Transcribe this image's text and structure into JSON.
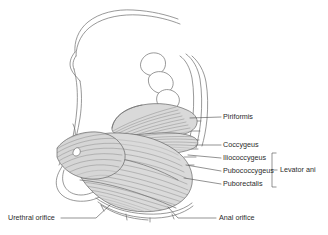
{
  "figure": {
    "background_color": "#ffffff",
    "line_color": "#6d6d6d",
    "muscle_fill_color": "#d8d8d8",
    "text_color": "#2b2b2b"
  },
  "labels": {
    "piriformis": "Piriformis",
    "coccygeus": "Coccygeus",
    "iliococcygeus": "Iliococcygeus",
    "pubococcygeus": "Pubococcygeus",
    "puborectalis": "Puborectalis",
    "levator_ani": "Levator ani",
    "urethral_orifice": "Urethral orifice",
    "anal_orifice": "Anal orifice"
  },
  "structures": [
    {
      "name": "Piriformis",
      "group": "",
      "side": "right"
    },
    {
      "name": "Coccygeus",
      "group": "",
      "side": "right"
    },
    {
      "name": "Iliococcygeus",
      "group": "Levator ani",
      "side": "right"
    },
    {
      "name": "Pubococcygeus",
      "group": "Levator ani",
      "side": "right"
    },
    {
      "name": "Puborectalis",
      "group": "Levator ani",
      "side": "right"
    },
    {
      "name": "Urethral orifice",
      "group": "",
      "side": "bottom-left"
    },
    {
      "name": "Anal orifice",
      "group": "",
      "side": "bottom-right"
    }
  ],
  "group_bracket": {
    "label": "Levator ani",
    "members": [
      "Iliococcygeus",
      "Pubococcygeus",
      "Puborectalis"
    ]
  }
}
